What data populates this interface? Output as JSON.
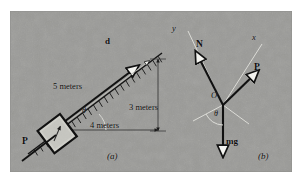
{
  "figure": {
    "panels": [
      {
        "id": "a",
        "caption": "(a)",
        "title": "inclined plane with block",
        "labels": {
          "displacement": "d",
          "hypotenuse": "5 meters",
          "base": "4 meters",
          "height": "3 meters",
          "applied_force": "P",
          "angle": "θ"
        }
      },
      {
        "id": "b",
        "caption": "(b)",
        "title": "free body diagram",
        "labels": {
          "normal_force": "N",
          "applied_force": "P",
          "weight": "mg",
          "origin": "O",
          "axis_x": "x",
          "axis_y": "y",
          "angle": "θ"
        }
      }
    ],
    "colors": {
      "background": "#9a9a97",
      "ink": "#101010",
      "axis_gray": "#d8d8d4",
      "arrowhead_fill": "#f2f2ee",
      "page": "#ffffff"
    }
  }
}
